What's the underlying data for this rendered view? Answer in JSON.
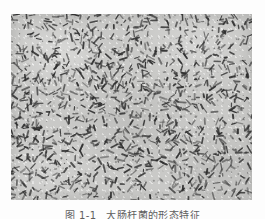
{
  "page": {
    "background_color": "#fdfdfd",
    "width": 265,
    "height": 219
  },
  "figure": {
    "type": "micrograph",
    "plate": {
      "x": 11,
      "y": 14,
      "width": 241,
      "height": 186,
      "background_color": "#c9c9c7",
      "particle_color": "#2e2e2e"
    },
    "rods": {
      "count": 1150,
      "min_length": 2.0,
      "max_length": 7.5,
      "thickness": 1.45,
      "seed": 20240617,
      "opacity_min": 0.38,
      "opacity_max": 0.95
    },
    "caption": {
      "figure_number": "图 1-1",
      "text": "大肠杆菌的形态特征",
      "cropped": true,
      "color": "#3a3a3a"
    }
  }
}
